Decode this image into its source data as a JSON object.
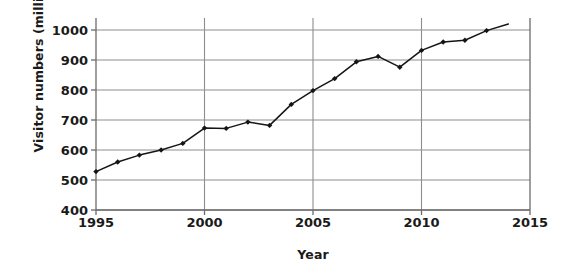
{
  "chart_data": {
    "type": "line",
    "title": "",
    "xlabel": "Year",
    "ylabel": "Visitor numbers (millions)",
    "x": [
      1995,
      1996,
      1997,
      1998,
      1999,
      2000,
      2001,
      2002,
      2003,
      2004,
      2005,
      2006,
      2007,
      2008,
      2009,
      2010,
      2011,
      2012,
      2013,
      2014
    ],
    "values": [
      528,
      560,
      583,
      600,
      622,
      673,
      672,
      693,
      682,
      752,
      798,
      838,
      894,
      912,
      876,
      932,
      960,
      966,
      998,
      1020
    ],
    "series": [
      {
        "name": "Visitor numbers",
        "values": [
          528,
          560,
          583,
          600,
          622,
          673,
          672,
          693,
          682,
          752,
          798,
          838,
          894,
          912,
          876,
          932,
          960,
          966,
          998,
          1020
        ]
      }
    ],
    "xlim": [
      1995,
      2015
    ],
    "ylim": [
      400,
      1030
    ],
    "y_ticks": [
      400,
      500,
      600,
      700,
      800,
      900,
      1000
    ],
    "x_ticks": [
      1995,
      2000,
      2005,
      2010,
      2015
    ],
    "y_tick_labels": [
      "400",
      "500",
      "600",
      "700",
      "800",
      "900",
      "1000"
    ],
    "x_tick_labels": [
      "1995",
      "2000",
      "2005",
      "2010",
      "2015"
    ],
    "grid": true,
    "grid_orientation": "both",
    "legend": null,
    "legend_position": "none",
    "marker": "diamond",
    "line_color": "#151515",
    "grid_color": "#8d8d8d",
    "axis_color": "#6b6b6b",
    "background": "#ffffff"
  }
}
